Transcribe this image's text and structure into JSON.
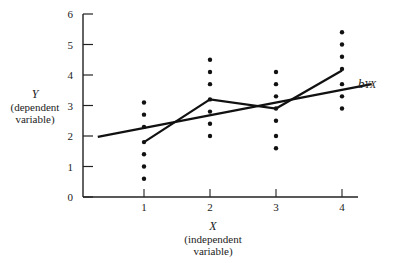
{
  "chart_data": {
    "type": "scatter",
    "title": "",
    "xlabel": "X",
    "xlabel_sub": [
      "(independent",
      "variable)"
    ],
    "ylabel": "Y",
    "ylabel_sub": [
      "(dependent",
      "variable)"
    ],
    "xlim": [
      0,
      4.5
    ],
    "ylim": [
      0,
      6
    ],
    "x_ticks": [
      1,
      2,
      3,
      4
    ],
    "y_ticks": [
      0,
      1,
      2,
      3,
      4,
      5,
      6
    ],
    "grid": false,
    "legend": "none",
    "series": [
      {
        "name": "observations",
        "kind": "scatter",
        "points": [
          {
            "x": 1,
            "ys": [
              3.1,
              2.7,
              2.3,
              1.8,
              1.4,
              1.0,
              0.6
            ]
          },
          {
            "x": 2,
            "ys": [
              4.5,
              4.1,
              3.7,
              3.2,
              2.8,
              2.4,
              2.0
            ]
          },
          {
            "x": 3,
            "ys": [
              4.1,
              3.7,
              3.3,
              2.9,
              2.5,
              2.0,
              1.6
            ]
          },
          {
            "x": 4,
            "ys": [
              5.4,
              5.0,
              4.6,
              4.2,
              3.7,
              3.3,
              2.9
            ]
          }
        ]
      },
      {
        "name": "conditional means",
        "kind": "line",
        "x": [
          1,
          2,
          3,
          4
        ],
        "y": [
          1.8,
          3.2,
          2.9,
          4.15
        ]
      },
      {
        "name": "regression line",
        "kind": "line",
        "x": [
          0.3,
          4.45
        ],
        "y": [
          1.97,
          3.7
        ]
      }
    ],
    "annotations": [
      {
        "text": "b",
        "subscript": "YX",
        "x": 4.5,
        "y": 3.75
      }
    ]
  }
}
